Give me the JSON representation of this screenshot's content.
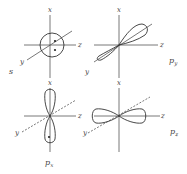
{
  "figure": {
    "axis_labels": {
      "x": "x",
      "y": "y",
      "z": "z"
    },
    "panels": [
      {
        "id": "s",
        "name": "s",
        "subscript": "",
        "shape": "sphere",
        "electrons": 2
      },
      {
        "id": "py",
        "name": "p",
        "subscript": "y",
        "shape": "dumbbell-along-y",
        "electrons": 0
      },
      {
        "id": "px",
        "name": "p",
        "subscript": "x",
        "shape": "dumbbell-along-x",
        "electrons": 1
      },
      {
        "id": "pz",
        "name": "p",
        "subscript": "z",
        "shape": "dumbbell-along-z",
        "electrons": 0
      }
    ]
  }
}
